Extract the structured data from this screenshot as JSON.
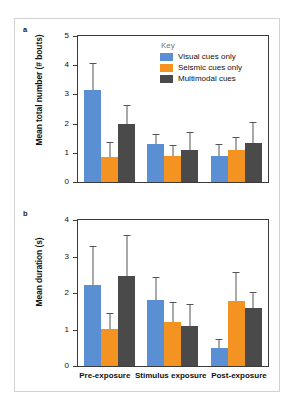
{
  "figure": {
    "panel_a_letter": "a",
    "panel_b_letter": "b"
  },
  "legend": {
    "title": "Key",
    "entries": [
      {
        "label": "Visual cues only",
        "color": "#5B8FD4"
      },
      {
        "label": "Seismic cues only",
        "color": "#F59322"
      },
      {
        "label": "Multimodal cues",
        "color": "#4A4A4A"
      }
    ]
  },
  "chart_data": [
    {
      "type": "bar",
      "panel": "a",
      "title": "",
      "xlabel": "",
      "ylabel": "Mean total number (# bouts)",
      "ylim": [
        0,
        5
      ],
      "yticks": [
        0,
        1,
        2,
        3,
        4,
        5
      ],
      "grid": false,
      "legend_position": "top-right",
      "categories": [
        "Pre-exposure",
        "Stimulus exposure",
        "Post-exposure"
      ],
      "series": [
        {
          "name": "Visual cues only",
          "color": "#5B8FD4",
          "values": [
            3.15,
            1.3,
            0.88
          ],
          "errors_upper": [
            4.05,
            1.62,
            1.28
          ]
        },
        {
          "name": "Seismic cues only",
          "color": "#F59322",
          "values": [
            0.87,
            0.9,
            1.09
          ],
          "errors_upper": [
            1.35,
            1.23,
            1.5
          ]
        },
        {
          "name": "Multimodal cues",
          "color": "#4A4A4A",
          "values": [
            1.97,
            1.11,
            1.32
          ],
          "errors_upper": [
            2.6,
            1.68,
            2.02
          ]
        }
      ]
    },
    {
      "type": "bar",
      "panel": "b",
      "title": "",
      "xlabel": "",
      "ylabel": "Mean duration (s)",
      "ylim": [
        0,
        4
      ],
      "yticks": [
        0,
        1,
        2,
        3,
        4
      ],
      "grid": false,
      "legend_position": "none",
      "categories": [
        "Pre-exposure",
        "Stimulus exposure",
        "Post-exposure"
      ],
      "series": [
        {
          "name": "Visual cues only",
          "color": "#5B8FD4",
          "values": [
            2.22,
            1.8,
            0.5
          ],
          "errors_upper": [
            3.25,
            2.41,
            0.7
          ]
        },
        {
          "name": "Seismic cues only",
          "color": "#F59322",
          "values": [
            1.01,
            1.21,
            1.77
          ],
          "errors_upper": [
            1.43,
            1.73,
            2.55
          ]
        },
        {
          "name": "Multimodal cues",
          "color": "#4A4A4A",
          "values": [
            2.46,
            1.1,
            1.6
          ],
          "errors_upper": [
            3.55,
            1.68,
            2.0
          ]
        }
      ]
    }
  ]
}
